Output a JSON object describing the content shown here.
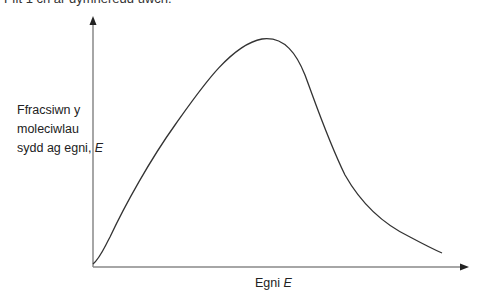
{
  "header": {
    "cut_text": "Ffit 1 ch ar dymheredd uwch."
  },
  "diagram": {
    "y_axis_label_lines": [
      "Ffracsiwn y",
      "moleciwlau",
      "sydd ag egni,"
    ],
    "y_axis_label_var": "E",
    "x_axis_label": "Egni",
    "x_axis_label_var": "E",
    "curve_description": "Maxwell-Boltzmann distribution of molecular energies",
    "axis_color": "#888888",
    "curve_color": "#333333"
  }
}
